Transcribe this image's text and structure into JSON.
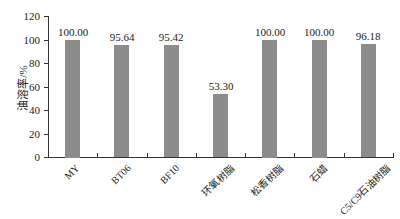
{
  "chart_data": {
    "type": "bar",
    "title": "",
    "xlabel": "",
    "ylabel": "油溶率/%",
    "ylim": [
      0,
      120
    ],
    "yticks": [
      0,
      20,
      40,
      60,
      80,
      100,
      120
    ],
    "grid": false,
    "legend": null,
    "bar_color": "#8c8c8c",
    "categories": [
      "MY",
      "BT06",
      "BF10",
      "环氧树脂",
      "松香树脂",
      "石蜡",
      "C5/C9石油树脂"
    ],
    "values": [
      100.0,
      95.64,
      95.42,
      53.3,
      100.0,
      100.0,
      96.18
    ],
    "value_labels": [
      "100.00",
      "95.64",
      "95.42",
      "53.30",
      "100.00",
      "100.00",
      "96.18"
    ]
  }
}
